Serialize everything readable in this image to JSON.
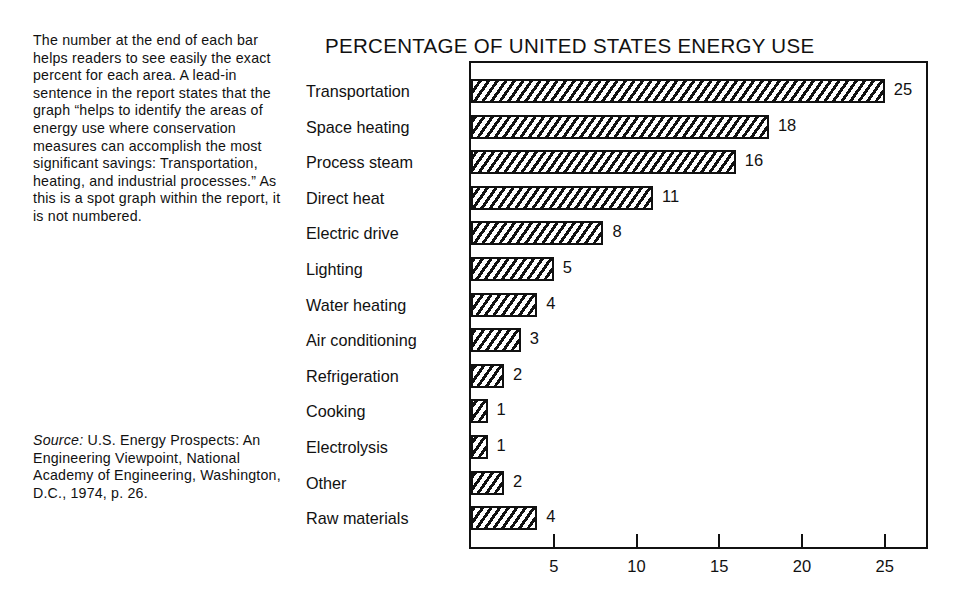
{
  "sidenote": {
    "text": "The number at the end of each bar helps readers to see easily the exact percent for each area. A lead-in sentence in the report states that the graph “helps to identify the areas of energy use where conservation measures can accomplish the most significant savings: Transportation, heating, and industrial processes.” As this is a spot graph within the report, it is not numbered."
  },
  "source": {
    "label": "Source:",
    "text": " U.S. Energy Prospects: An Engineering Viewpoint, National Academy of Engineering, Washington, D.C., 1974, p. 26."
  },
  "chart_data": {
    "type": "bar",
    "orientation": "horizontal",
    "title": "PERCENTAGE OF UNITED STATES ENERGY USE",
    "xlabel": "",
    "ylabel": "",
    "categories": [
      "Transportation",
      "Space heating",
      "Process steam",
      "Direct heat",
      "Electric drive",
      "Lighting",
      "Water heating",
      "Air conditioning",
      "Refrigeration",
      "Cooking",
      "Electrolysis",
      "Other",
      "Raw materials"
    ],
    "values": [
      25,
      18,
      16,
      11,
      8,
      5,
      4,
      3,
      2,
      1,
      1,
      2,
      4
    ],
    "value_labels": [
      "25",
      "18",
      "16",
      "11",
      "8",
      "5",
      "4",
      "3",
      "2",
      "1",
      "1",
      "2",
      "4"
    ],
    "xlim": [
      0,
      27.5
    ],
    "xticks": [
      5,
      10,
      15,
      20,
      25
    ],
    "xtick_labels": [
      "5",
      "10",
      "15",
      "20",
      "25"
    ],
    "grid": false,
    "legend": null,
    "bar_fill": "diagonal-hatch",
    "colors": {
      "ink": "#111111",
      "background": "#ffffff"
    }
  }
}
